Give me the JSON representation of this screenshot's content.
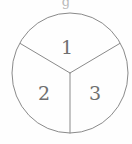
{
  "figure": {
    "type": "sector-diagram",
    "background_color": "#fefefe",
    "stroke_color": "#8a8a8a",
    "label_color": "#6f6f6f",
    "stroke_width": 1,
    "circle": {
      "center_x": 70,
      "center_y": 73,
      "radius_x": 58,
      "radius_y": 60
    },
    "top_artifact": {
      "text": "g",
      "x": 66,
      "y": 6,
      "color": "#b9b9b9"
    },
    "sectors": [
      {
        "name": "sector-1",
        "label": "1",
        "label_x": 67,
        "label_y": 49,
        "start_angle_deg": -150,
        "end_angle_deg": -30
      },
      {
        "name": "sector-2",
        "label": "2",
        "label_x": 44,
        "label_y": 95,
        "start_angle_deg": 90,
        "end_angle_deg": 210
      },
      {
        "name": "sector-3",
        "label": "3",
        "label_x": 95,
        "label_y": 95,
        "start_angle_deg": -30,
        "end_angle_deg": 90
      }
    ],
    "radii": [
      {
        "name": "radius-upper-left",
        "x1": 70,
        "y1": 73,
        "x2": 20,
        "y2": 44
      },
      {
        "name": "radius-upper-right",
        "x1": 70,
        "y1": 73,
        "x2": 120,
        "y2": 44
      },
      {
        "name": "radius-bottom",
        "x1": 70,
        "y1": 73,
        "x2": 70,
        "y2": 133
      }
    ]
  }
}
